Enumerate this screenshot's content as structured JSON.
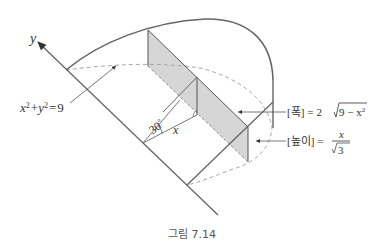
{
  "figure": {
    "caption": "그림 7.14",
    "axis_label": "y",
    "circle_equation": "x² + y² = 9",
    "circle_equation_parts": {
      "lhs_x": "x",
      "lhs_y": "y",
      "exp": "2",
      "plus": "+",
      "eq": "=",
      "rhs": "9"
    },
    "angle_label": "30°",
    "angle_value": "30",
    "degree": "°",
    "segment_label": "x",
    "width_label": {
      "bracket_text": "[폭]",
      "equals": "=",
      "coefficient": "2",
      "radicand": "9 − x",
      "exp": "2"
    },
    "height_label": {
      "bracket_text": "[높이]",
      "equals": "=",
      "numerator": "x",
      "denominator_root": "3"
    },
    "colors": {
      "stroke": "#666666",
      "shade": "#d6d6d6",
      "dashed": "#a8a8a8",
      "text": "#333333"
    }
  }
}
